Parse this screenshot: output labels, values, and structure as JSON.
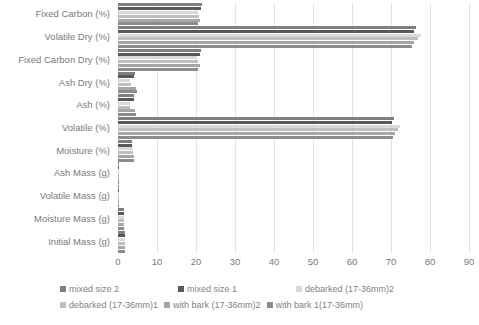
{
  "chart_data": {
    "type": "bar",
    "orientation": "horizontal",
    "title": "",
    "xlabel": "",
    "ylabel": "",
    "xlim": [
      0,
      90
    ],
    "xticks": [
      0,
      10,
      20,
      30,
      40,
      50,
      60,
      70,
      80,
      90
    ],
    "grid": true,
    "legend_position": "bottom",
    "categories": [
      "Fixed Carbon (%)",
      "Volatile Dry (%)",
      "Fixed Carbon Dry (%)",
      "Ash Dry (%)",
      "Ash (%)",
      "Volatile (%)",
      "Moisture (%)",
      "Ash Mass (g)",
      "Volatile Mass (g)",
      "Moisture Mass (g)",
      "Initial Mass (g)"
    ],
    "series": [
      {
        "name": "mixed size 2",
        "color": "#7f7f7f",
        "values": [
          21.5,
          76.5,
          21.3,
          4.4,
          4.2,
          70.8,
          3.6,
          0.1,
          0.35,
          1.6,
          1.8
        ]
      },
      {
        "name": "mixed size 1",
        "color": "#595959",
        "values": [
          21.2,
          75.8,
          21.0,
          4.2,
          4.0,
          70.2,
          3.5,
          0.1,
          0.3,
          1.5,
          1.75
        ]
      },
      {
        "name": "debarked (17-36mm)2",
        "color": "#d9d9d9",
        "values": [
          20.4,
          77.6,
          20.1,
          3.1,
          3.0,
          72.4,
          3.9,
          0.08,
          0.3,
          1.5,
          1.7
        ]
      },
      {
        "name": "debarked (17-36mm)1",
        "color": "#bfbfbf",
        "values": [
          20.8,
          77.0,
          20.6,
          3.3,
          3.2,
          71.9,
          3.8,
          0.08,
          0.3,
          1.5,
          1.7
        ]
      },
      {
        "name": "with bark (17-36mm)2",
        "color": "#a6a6a6",
        "values": [
          21.0,
          76.0,
          20.9,
          4.6,
          4.4,
          71.0,
          4.1,
          0.1,
          0.3,
          1.5,
          1.7
        ]
      },
      {
        "name": "with bark 1(17-36mm)",
        "color": "#8c8c8c",
        "values": [
          20.6,
          75.4,
          20.5,
          4.8,
          4.6,
          70.5,
          4.2,
          0.1,
          0.3,
          1.5,
          1.7
        ]
      }
    ]
  },
  "axis": {
    "tick_labels": [
      "0",
      "10",
      "20",
      "30",
      "40",
      "50",
      "60",
      "70",
      "80",
      "90"
    ]
  }
}
